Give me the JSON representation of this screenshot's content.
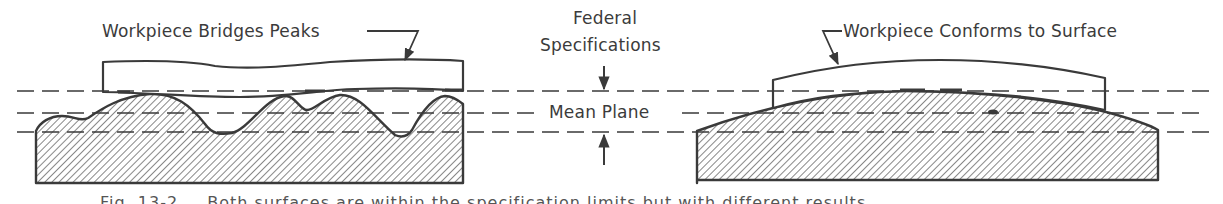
{
  "diagram": {
    "type": "cross-section comparison",
    "panels": [
      {
        "id": "left",
        "label": "Workpiece Bridges Peaks",
        "surface": "wavy (multiple peaks and valleys)"
      },
      {
        "id": "right",
        "label": "Workpiece Conforms to Surface",
        "surface": "smooth convex dome"
      }
    ],
    "center_labels": {
      "spec_line1": "Federal",
      "spec_line2": "Specifications",
      "mean_plane": "Mean Plane"
    },
    "reference_lines": [
      "upper specification limit",
      "mean plane",
      "lower specification limit"
    ],
    "caption_partial": "Fig. 13-2 … Both surfaces are within the specification limits but with different results",
    "colors": {
      "ink": "#3a3a3a",
      "hatch": "#6a6a6a",
      "background": "#ffffff"
    }
  }
}
